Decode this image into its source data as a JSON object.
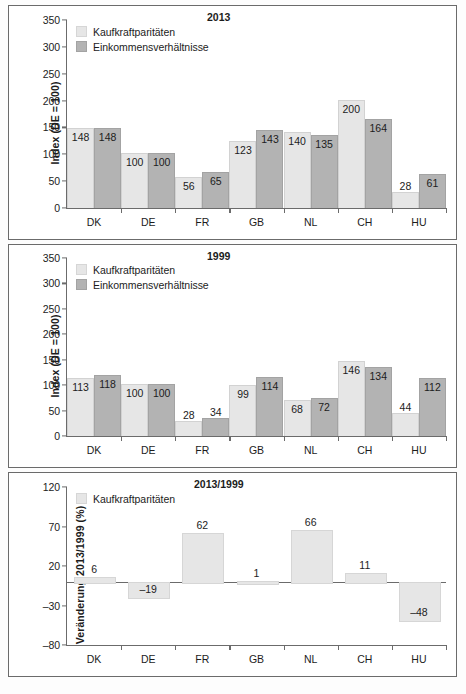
{
  "chart_data": [
    {
      "type": "bar",
      "title": "2013",
      "xlabel": "",
      "ylabel": "Index (DE = 100)",
      "ylim": [
        0,
        350
      ],
      "yticks": [
        "0",
        "50",
        "100",
        "150",
        "200",
        "250",
        "300",
        "350"
      ],
      "categories": [
        "DK",
        "DE",
        "FR",
        "GB",
        "NL",
        "CH",
        "HU"
      ],
      "legend": [
        "Kaufkraftparitäten",
        "Einkommensverhältnisse"
      ],
      "legend_position": "top-left",
      "grid": false,
      "series": [
        {
          "name": "Kaufkraftparitäten",
          "values": [
            148,
            100,
            56,
            123,
            140,
            200,
            28
          ]
        },
        {
          "name": "Einkommensverhältnisse",
          "values": [
            148,
            100,
            65,
            143,
            135,
            164,
            61
          ]
        }
      ]
    },
    {
      "type": "bar",
      "title": "1999",
      "xlabel": "",
      "ylabel": "Index (DE = 100)",
      "ylim": [
        0,
        350
      ],
      "yticks": [
        "0",
        "50",
        "100",
        "150",
        "200",
        "250",
        "300",
        "350"
      ],
      "categories": [
        "DK",
        "DE",
        "FR",
        "GB",
        "NL",
        "CH",
        "HU"
      ],
      "legend": [
        "Kaufkraftparitäten",
        "Einkommensverhältnisse"
      ],
      "legend_position": "top-left",
      "grid": false,
      "series": [
        {
          "name": "Kaufkraftparitäten",
          "values": [
            113,
            100,
            28,
            99,
            68,
            146,
            44
          ]
        },
        {
          "name": "Einkommensverhältnisse",
          "values": [
            118,
            100,
            34,
            114,
            72,
            134,
            112
          ]
        }
      ]
    },
    {
      "type": "bar",
      "title": "2013/1999",
      "xlabel": "",
      "ylabel": "Veränderung 2013/1999 (%)",
      "ylim": [
        -80,
        120
      ],
      "yticks": [
        "-80",
        "-30",
        "20",
        "70",
        "120"
      ],
      "ytick_display": [
        "–80",
        "–30",
        "20",
        "70",
        "120"
      ],
      "categories": [
        "DK",
        "DE",
        "FR",
        "GB",
        "NL",
        "CH",
        "HU"
      ],
      "legend": [
        "Kaufkraftparitäten"
      ],
      "legend_position": "top-left",
      "grid": false,
      "series": [
        {
          "name": "Kaufkraftparitäten",
          "values": [
            6,
            -19,
            62,
            1,
            66,
            11,
            -48
          ]
        }
      ],
      "value_labels": [
        "6",
        "–19",
        "62",
        "1",
        "66",
        "11",
        "–48"
      ]
    }
  ],
  "colors": {
    "light_bar": "#e6e6e6",
    "dark_bar": "#b3b3b3",
    "axis": "#6b6b6b",
    "text": "#1c1c1c",
    "background": "#ffffff"
  }
}
